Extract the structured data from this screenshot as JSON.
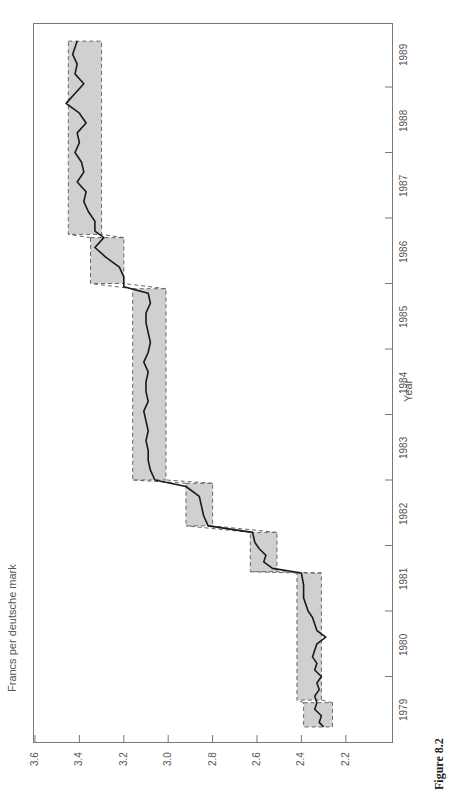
{
  "chart_data": {
    "type": "line",
    "orientation": "rotated-90-ccw",
    "title": "",
    "caption": "Figure 8.2",
    "xlabel": "Year",
    "ylabel": "Francs per deutsche mark",
    "ylim": [
      2.1,
      3.6
    ],
    "yticks": [
      "3.6",
      "3.4",
      "3.2",
      "3.0",
      "2.8",
      "2.6",
      "2.4",
      "2.2"
    ],
    "xticks": [
      "1979",
      "1980",
      "1981",
      "1982",
      "1983",
      "1984",
      "1985",
      "1986",
      "1987",
      "1988",
      "1989"
    ],
    "xlim": [
      1979,
      1989.75
    ],
    "grid": false,
    "bands": [
      {
        "name": "EMS band 1",
        "t0": 1979.23,
        "t1": 1979.6,
        "lower": 2.26,
        "upper": 2.39
      },
      {
        "name": "EMS band 2",
        "t0": 1979.64,
        "t1": 1981.58,
        "lower": 2.31,
        "upper": 2.42
      },
      {
        "name": "EMS band 3",
        "t0": 1981.6,
        "t1": 1982.2,
        "lower": 2.51,
        "upper": 2.63
      },
      {
        "name": "EMS band 4",
        "t0": 1982.3,
        "t1": 1982.95,
        "lower": 2.8,
        "upper": 2.92
      },
      {
        "name": "EMS band 5",
        "t0": 1983.0,
        "t1": 1985.92,
        "lower": 3.01,
        "upper": 3.16
      },
      {
        "name": "EMS band 6",
        "t0": 1986.0,
        "t1": 1986.7,
        "lower": 3.2,
        "upper": 3.35
      },
      {
        "name": "EMS band 7",
        "t0": 1986.75,
        "t1": 1989.7,
        "lower": 3.3,
        "upper": 3.45
      }
    ],
    "series": [
      {
        "name": "Franc/DM exchange rate",
        "x": [
          1979.23,
          1979.3,
          1979.4,
          1979.5,
          1979.6,
          1979.7,
          1979.8,
          1979.9,
          1980.0,
          1980.1,
          1980.2,
          1980.3,
          1980.4,
          1980.5,
          1980.6,
          1980.7,
          1980.8,
          1980.9,
          1981.0,
          1981.2,
          1981.4,
          1981.58,
          1981.65,
          1981.75,
          1981.85,
          1981.95,
          1982.05,
          1982.2,
          1982.3,
          1982.45,
          1982.6,
          1982.75,
          1982.9,
          1983.0,
          1983.15,
          1983.3,
          1983.45,
          1983.6,
          1983.75,
          1983.9,
          1984.05,
          1984.2,
          1984.35,
          1984.5,
          1984.65,
          1984.8,
          1984.95,
          1985.1,
          1985.25,
          1985.4,
          1985.55,
          1985.7,
          1985.85,
          1985.95,
          1986.1,
          1986.25,
          1986.4,
          1986.55,
          1986.7,
          1986.8,
          1986.95,
          1987.1,
          1987.25,
          1987.4,
          1987.55,
          1987.7,
          1987.85,
          1988.0,
          1988.15,
          1988.3,
          1988.45,
          1988.6,
          1988.75,
          1988.9,
          1989.05,
          1989.2,
          1989.35,
          1989.5,
          1989.7
        ],
        "values": [
          2.3,
          2.32,
          2.31,
          2.34,
          2.33,
          2.34,
          2.32,
          2.33,
          2.31,
          2.34,
          2.33,
          2.35,
          2.34,
          2.33,
          2.29,
          2.33,
          2.34,
          2.35,
          2.37,
          2.39,
          2.39,
          2.4,
          2.53,
          2.57,
          2.56,
          2.59,
          2.61,
          2.62,
          2.82,
          2.84,
          2.85,
          2.86,
          2.92,
          3.06,
          3.08,
          3.09,
          3.09,
          3.1,
          3.09,
          3.1,
          3.11,
          3.09,
          3.1,
          3.1,
          3.09,
          3.11,
          3.09,
          3.08,
          3.09,
          3.1,
          3.1,
          3.08,
          3.09,
          3.2,
          3.2,
          3.22,
          3.28,
          3.33,
          3.29,
          3.33,
          3.33,
          3.36,
          3.38,
          3.37,
          3.41,
          3.38,
          3.39,
          3.42,
          3.4,
          3.41,
          3.37,
          3.4,
          3.46,
          3.42,
          3.38,
          3.42,
          3.41,
          3.43,
          3.41
        ]
      }
    ]
  }
}
